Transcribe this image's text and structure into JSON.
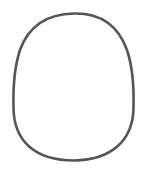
{
  "canvas": {
    "width": 159,
    "height": 175,
    "background": "#ffffff"
  },
  "shape": {
    "kind": "egg-outline",
    "stroke_color": "#555555",
    "stroke_width": 2.6,
    "fill": "none",
    "bounds": {
      "left": 13,
      "top": 13,
      "right": 134,
      "bottom": 161
    }
  }
}
